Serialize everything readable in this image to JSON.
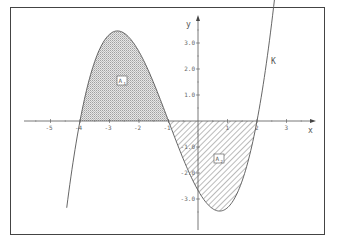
{
  "chart_data": {
    "type": "area",
    "title": "",
    "function_label": "K",
    "function_expression": "K(x) = (1/3)(x+4)(x+1)(x-2)",
    "xlabel": "x",
    "ylabel": "y",
    "x_ticks": [
      -5,
      -4,
      -3,
      -2,
      -1,
      1,
      2,
      3
    ],
    "x_tick_labels": [
      "-5",
      "-4",
      "-3",
      "-2",
      "-1",
      "1",
      "2",
      "3"
    ],
    "y_ticks": [
      3.0,
      2.0,
      1.0,
      -1.0,
      -2.0,
      -3.0
    ],
    "y_tick_labels": [
      "3.0",
      "2.0",
      "1.0",
      "-1.0",
      "-2.0",
      "-3.0"
    ],
    "xlim": [
      -5.8,
      4.0
    ],
    "ylim": [
      -4.0,
      4.0
    ],
    "grid": false,
    "roots": [
      -4,
      -1,
      2
    ],
    "extrema": [
      {
        "type": "max",
        "x": -2.7,
        "y": 3.46
      },
      {
        "type": "min",
        "x": 0.7,
        "y": -3.46
      }
    ],
    "curve_domain": [
      -4.45,
      2.6
    ],
    "regions": [
      {
        "name": "A1",
        "label": "A",
        "subscript": "1",
        "from": -4,
        "to": -1,
        "fill": "dotted-gray",
        "position": "above x-axis"
      },
      {
        "name": "A2",
        "label": "A",
        "subscript": "2",
        "from": -1,
        "to": 2,
        "fill": "diagonal-hatch",
        "position": "below x-axis"
      }
    ]
  },
  "labels": {
    "x_axis": "x",
    "y_axis": "y",
    "curve": "K",
    "a1_main": "A",
    "a1_sub": "1",
    "a2_main": "A",
    "a2_sub": "2"
  },
  "ticks_x": [
    "-5",
    "-4",
    "-3",
    "-2",
    "-1",
    "1",
    "2",
    "3"
  ],
  "ticks_y": [
    "3.0",
    "2.0",
    "1.0",
    "-1.0",
    "-2.0",
    "-3.0"
  ],
  "colors": {
    "curve": "#555555",
    "axis": "#555555",
    "frame": "#444444",
    "dots": "#9a9a9a",
    "hatch": "#666666"
  }
}
